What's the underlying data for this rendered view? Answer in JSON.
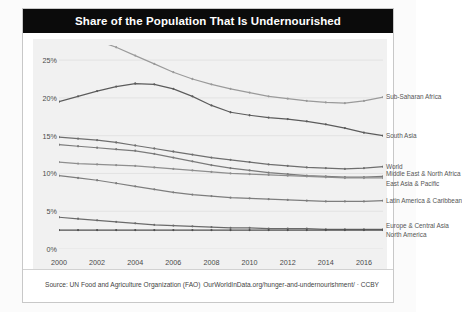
{
  "header": {
    "title": "Share of the Population That Is Undernourished"
  },
  "footer": {
    "source": "Source: UN Food and Agriculture Organization (FAO)",
    "attribution": "OurWorldInData.org/hunger-and-undernourishment/ · CCBY"
  },
  "chart_data": {
    "type": "line",
    "title": "Share of the Population That Is Undernourished",
    "xlabel": "",
    "ylabel": "",
    "xlim": [
      2000,
      2017
    ],
    "ylim": [
      0,
      27
    ],
    "grid": true,
    "legend_position": "right-end-labels",
    "y_ticks": [
      "0%",
      "5%",
      "10%",
      "15%",
      "20%",
      "25%"
    ],
    "y_tick_values": [
      0,
      5,
      10,
      15,
      20,
      25
    ],
    "x_ticks": [
      "2000",
      "2002",
      "2004",
      "2006",
      "2008",
      "2010",
      "2012",
      "2014",
      "2016"
    ],
    "x_tick_values": [
      2000,
      2002,
      2004,
      2006,
      2008,
      2010,
      2012,
      2014,
      2016
    ],
    "x": [
      2000,
      2001,
      2002,
      2003,
      2004,
      2005,
      2006,
      2007,
      2008,
      2009,
      2010,
      2011,
      2012,
      2013,
      2014,
      2015,
      2016,
      2017
    ],
    "series": [
      {
        "name": "Sub-Saharan Africa",
        "color": "#9a9a9a",
        "values": [
          28.8,
          28.3,
          27.6,
          26.7,
          25.6,
          24.5,
          23.4,
          22.5,
          21.8,
          21.2,
          20.7,
          20.2,
          19.9,
          19.6,
          19.4,
          19.3,
          19.6,
          20.1
        ]
      },
      {
        "name": "South Asia",
        "color": "#5b5b5b",
        "values": [
          19.5,
          20.2,
          20.9,
          21.5,
          21.9,
          21.8,
          21.2,
          20.2,
          19.0,
          18.1,
          17.7,
          17.4,
          17.2,
          16.9,
          16.5,
          16.0,
          15.4,
          15.0
        ]
      },
      {
        "name": "World",
        "color": "#6e6e6e",
        "values": [
          14.8,
          14.6,
          14.4,
          14.1,
          13.7,
          13.3,
          12.9,
          12.5,
          12.1,
          11.8,
          11.5,
          11.2,
          11.0,
          10.8,
          10.7,
          10.6,
          10.7,
          10.9
        ]
      },
      {
        "name": "Middle East & North Africa",
        "color": "#7a7a7a",
        "values": [
          13.8,
          13.6,
          13.4,
          13.2,
          13.0,
          12.6,
          12.1,
          11.6,
          11.1,
          10.7,
          10.4,
          10.1,
          9.9,
          9.7,
          9.6,
          9.5,
          9.5,
          9.6
        ]
      },
      {
        "name": "East Asia & Pacific",
        "color": "#8e8e8e",
        "values": [
          11.5,
          11.3,
          11.2,
          11.1,
          11.0,
          10.8,
          10.6,
          10.4,
          10.2,
          10.0,
          9.9,
          9.8,
          9.7,
          9.6,
          9.5,
          9.4,
          9.4,
          9.4
        ]
      },
      {
        "name": "Latin America & Caribbean",
        "color": "#7d7d7d",
        "values": [
          9.7,
          9.4,
          9.1,
          8.7,
          8.3,
          7.9,
          7.5,
          7.2,
          7.0,
          6.8,
          6.7,
          6.6,
          6.5,
          6.4,
          6.3,
          6.3,
          6.3,
          6.4
        ]
      },
      {
        "name": "Europe & Central Asia",
        "color": "#6a6a6a",
        "values": [
          4.2,
          4.0,
          3.8,
          3.6,
          3.4,
          3.2,
          3.1,
          3.0,
          2.9,
          2.8,
          2.8,
          2.7,
          2.7,
          2.7,
          2.6,
          2.6,
          2.6,
          2.6
        ]
      },
      {
        "name": "North America",
        "color": "#4f4f4f",
        "values": [
          2.5,
          2.5,
          2.5,
          2.5,
          2.5,
          2.5,
          2.5,
          2.5,
          2.5,
          2.5,
          2.5,
          2.5,
          2.5,
          2.5,
          2.5,
          2.5,
          2.5,
          2.5
        ]
      }
    ],
    "end_labels": [
      {
        "name": "Sub-Saharan Africa",
        "value": 20.1,
        "label_y": 20.1
      },
      {
        "name": "South Asia",
        "value": 15.0,
        "label_y": 15.0
      },
      {
        "name": "World",
        "value": 10.9,
        "label_y": 10.9
      },
      {
        "name": "Middle East & North Africa",
        "value": 9.6,
        "label_y": 9.9
      },
      {
        "name": "East Asia & Pacific",
        "value": 9.4,
        "label_y": 8.6
      },
      {
        "name": "Latin America & Caribbean",
        "value": 6.4,
        "label_y": 6.4
      },
      {
        "name": "Europe & Central Asia",
        "value": 2.6,
        "label_y": 3.1
      },
      {
        "name": "North America",
        "value": 2.5,
        "label_y": 1.8
      }
    ]
  }
}
